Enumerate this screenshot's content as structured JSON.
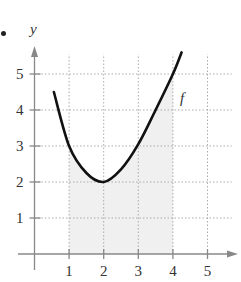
{
  "chart_data": {
    "type": "line",
    "title": "",
    "xlabel": "",
    "ylabel": "y",
    "xlim": [
      0,
      5.8
    ],
    "ylim": [
      0,
      5.8
    ],
    "grid": true,
    "x_ticks": [
      "1",
      "2",
      "3",
      "4",
      "5"
    ],
    "y_ticks": [
      "1",
      "2",
      "3",
      "4",
      "5"
    ],
    "series": [
      {
        "name": "f",
        "x": [
          0.56,
          1.0,
          1.5,
          2.0,
          2.5,
          3.0,
          3.5,
          4.0,
          4.25
        ],
        "y": [
          4.5,
          3.0,
          2.25,
          2.0,
          2.35,
          3.05,
          4.0,
          5.0,
          5.6
        ]
      }
    ],
    "shaded_region": {
      "x_from": 1,
      "x_to": 4,
      "under": "f"
    },
    "annotations": [
      {
        "text": "f",
        "x": 4.3,
        "y": 4.9
      }
    ],
    "colors": {
      "curve": "#111111",
      "axis": "#888888",
      "grid": "#aaaaaa",
      "shade": "#f0f0f0"
    }
  },
  "labels": {
    "y_axis": "y",
    "curve_label": "f"
  }
}
